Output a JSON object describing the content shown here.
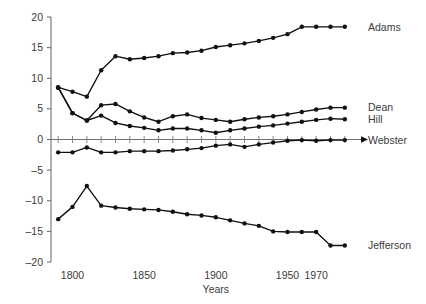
{
  "chart_data": {
    "type": "line",
    "title": "",
    "subtitle": "",
    "xlabel": "Years",
    "ylabel": "",
    "xlim": [
      1785,
      1995
    ],
    "ylim": [
      -20,
      20
    ],
    "grid": false,
    "legend_position": "right-inline-labels",
    "x_ticks": [
      1800,
      1850,
      1900,
      1950,
      1970
    ],
    "x_tick_labels": [
      "1800",
      "1850",
      "1900",
      "1950",
      "1970"
    ],
    "y_ticks": [
      -20,
      -15,
      -10,
      -5,
      0,
      5,
      10,
      15,
      20
    ],
    "y_tick_labels": [
      "–20",
      "–15",
      "–10",
      "–5",
      "0",
      "5",
      "10",
      "15",
      "20"
    ],
    "x": [
      1790,
      1800,
      1810,
      1820,
      1830,
      1840,
      1850,
      1860,
      1870,
      1880,
      1890,
      1900,
      1910,
      1920,
      1930,
      1940,
      1950,
      1960,
      1970,
      1980,
      1990
    ],
    "series": [
      {
        "name": "Adams",
        "label": "Adams",
        "values": [
          8.5,
          7.8,
          7.0,
          11.3,
          13.6,
          13.1,
          13.3,
          13.6,
          14.1,
          14.2,
          14.5,
          15.1,
          15.4,
          15.7,
          16.1,
          16.6,
          17.2,
          18.4,
          18.4,
          18.4,
          18.4
        ]
      },
      {
        "name": "Dean",
        "label": "Dean",
        "values": [
          8.5,
          4.3,
          3.1,
          5.6,
          5.8,
          4.6,
          3.6,
          2.9,
          3.8,
          4.1,
          3.5,
          3.2,
          2.9,
          3.3,
          3.6,
          3.8,
          4.1,
          4.5,
          4.9,
          5.2,
          5.2
        ]
      },
      {
        "name": "Hill",
        "label": "Hill",
        "values": [
          8.5,
          4.3,
          3.1,
          3.9,
          2.7,
          2.2,
          1.9,
          1.5,
          1.8,
          1.8,
          1.5,
          1.1,
          1.5,
          1.8,
          2.1,
          2.3,
          2.6,
          2.9,
          3.2,
          3.4,
          3.3
        ]
      },
      {
        "name": "Webster",
        "label": "Webster",
        "values": [
          -2.1,
          -2.1,
          -1.3,
          -2.1,
          -2.1,
          -1.9,
          -1.9,
          -1.9,
          -1.8,
          -1.6,
          -1.4,
          -1.0,
          -0.8,
          -1.2,
          -0.8,
          -0.5,
          -0.2,
          -0.1,
          -0.2,
          -0.1,
          -0.1
        ]
      },
      {
        "name": "Jefferson",
        "label": "Jefferson",
        "values": [
          -13.0,
          -11.0,
          -7.6,
          -10.8,
          -11.1,
          -11.3,
          -11.4,
          -11.5,
          -11.8,
          -12.2,
          -12.4,
          -12.7,
          -13.2,
          -13.7,
          -14.1,
          -15.0,
          -15.1,
          -15.1,
          -15.1,
          -17.3,
          -17.3
        ]
      }
    ],
    "series_label_positions": [
      {
        "name": "Adams",
        "y_value": 18.4
      },
      {
        "name": "Dean",
        "y_value": 5.2
      },
      {
        "name": "Hill",
        "y_value": 3.3
      },
      {
        "name": "Webster",
        "y_value": -0.1
      },
      {
        "name": "Jefferson",
        "y_value": -17.3
      }
    ],
    "colors": {
      "line": "#111111",
      "point": "#111111",
      "axis": "#6f6f6f",
      "text": "#3b3b3b",
      "background": "#ffffff"
    }
  }
}
